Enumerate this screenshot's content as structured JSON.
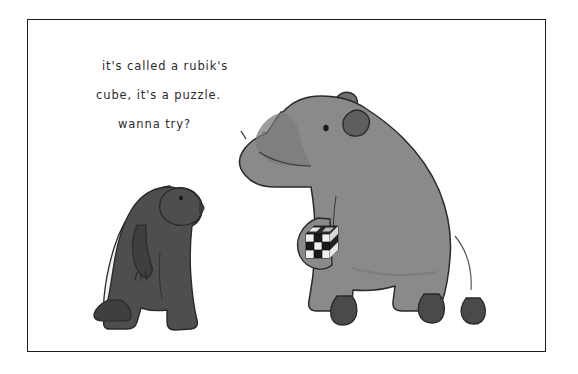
{
  "artwork": {
    "title": "Capybara and honey badger cartoon",
    "medium": "pen-and-ink cartoon illustration",
    "background_color": "#ffffff",
    "frame": {
      "name": "picture-frame-border",
      "color": "#1c1c1c",
      "x": 27,
      "y": 19,
      "width": 519,
      "height": 333
    }
  },
  "caption": {
    "speaker": "capybara",
    "lines": [
      "it's called a rubik's",
      "cube, it's a puzzle.",
      "wanna  try?"
    ],
    "full_text": "it's called a rubik's cube, it's a puzzle. wanna try?",
    "text_color": "#2b2b2b",
    "pointer_mark": "speech-tail-tick"
  },
  "characters": [
    {
      "name": "honey-badger",
      "role": "listener",
      "position": "left",
      "body_color": "#4e4e4e",
      "stripe_color": "#f2f2f2",
      "outline_color": "#2a2a2a",
      "pose": "standing upright on hind legs, facing right"
    },
    {
      "name": "capybara",
      "role": "speaker",
      "position": "right",
      "body_color": "#8a8a8a",
      "muzzle_color": "#7b7b7b",
      "foot_color": "#4a4a4a",
      "eye_color": "#1a1a1a",
      "outline_color": "#2a2a2a",
      "pose": "sitting, facing left, holding cube in front paw"
    }
  ],
  "props": [
    {
      "name": "rubiks-cube",
      "held_by": "capybara",
      "grid": 3,
      "face_colors": [
        "#1a1a1a",
        "#f0f0f0"
      ],
      "description": "small black-and-white checkered 3x3 cube"
    }
  ]
}
